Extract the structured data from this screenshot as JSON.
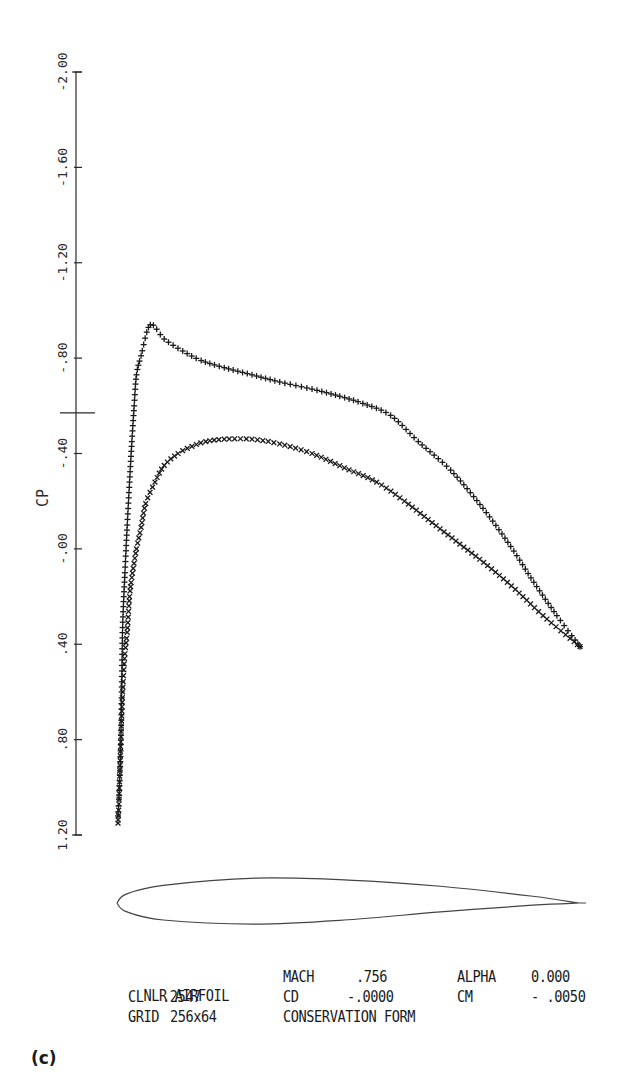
{
  "chart_data": {
    "type": "scatter",
    "title": "",
    "xlabel": "",
    "ylabel": "CP",
    "ylim": [
      -2.0,
      1.2
    ],
    "y_inverted": true,
    "grid": false,
    "y_ticks": [
      "-2.00",
      "-1.60",
      "-1.20",
      "-.80",
      "-.40",
      "-.00",
      ".40",
      ".80",
      "1.20"
    ],
    "y_tick_values": [
      -2.0,
      -1.6,
      -1.2,
      -0.8,
      -0.4,
      0.0,
      0.4,
      0.8,
      1.2
    ],
    "critical_cp_marker": -0.57,
    "series": [
      {
        "name": "upper surface",
        "marker": "+",
        "x": [
          0.0,
          0.002,
          0.004,
          0.006,
          0.008,
          0.01,
          0.015,
          0.02,
          0.025,
          0.03,
          0.035,
          0.04,
          0.05,
          0.07,
          0.1,
          0.14,
          0.18,
          0.23,
          0.29,
          0.35,
          0.42,
          0.48,
          0.53,
          0.59,
          0.65,
          0.72,
          0.79,
          0.85,
          0.9,
          0.95,
          1.0
        ],
        "values": [
          1.12,
          1.05,
          0.95,
          0.82,
          0.6,
          0.33,
          0.1,
          -0.1,
          -0.28,
          -0.45,
          -0.6,
          -0.73,
          -0.81,
          -0.94,
          -0.88,
          -0.83,
          -0.79,
          -0.76,
          -0.73,
          -0.7,
          -0.67,
          -0.64,
          -0.61,
          -0.56,
          -0.45,
          -0.33,
          -0.17,
          -0.01,
          0.14,
          0.28,
          0.41
        ]
      },
      {
        "name": "lower surface",
        "marker": "x",
        "x": [
          0.0,
          0.002,
          0.004,
          0.006,
          0.008,
          0.01,
          0.015,
          0.02,
          0.025,
          0.03,
          0.04,
          0.05,
          0.06,
          0.08,
          0.1,
          0.13,
          0.16,
          0.19,
          0.23,
          0.29,
          0.35,
          0.42,
          0.49,
          0.56,
          0.62,
          0.68,
          0.74,
          0.8,
          0.86,
          0.92,
          1.0
        ],
        "values": [
          1.15,
          1.07,
          0.93,
          0.81,
          0.7,
          0.6,
          0.44,
          0.35,
          0.2,
          0.12,
          0.0,
          -0.09,
          -0.19,
          -0.28,
          -0.35,
          -0.4,
          -0.43,
          -0.45,
          -0.46,
          -0.46,
          -0.44,
          -0.4,
          -0.34,
          -0.28,
          -0.2,
          -0.11,
          -0.02,
          0.07,
          0.17,
          0.28,
          0.41
        ]
      }
    ],
    "airfoil_outline": {
      "upper": [
        [
          0.0,
          0.0
        ],
        [
          0.02,
          0.033
        ],
        [
          0.1,
          0.065
        ],
        [
          0.3,
          0.092
        ],
        [
          0.5,
          0.085
        ],
        [
          0.7,
          0.062
        ],
        [
          0.9,
          0.025
        ],
        [
          1.0,
          0.0
        ]
      ],
      "lower": [
        [
          0.0,
          0.0
        ],
        [
          0.02,
          -0.032
        ],
        [
          0.1,
          -0.063
        ],
        [
          0.3,
          -0.078
        ],
        [
          0.5,
          -0.062
        ],
        [
          0.7,
          -0.033
        ],
        [
          0.9,
          -0.008
        ],
        [
          1.0,
          0.0
        ]
      ]
    }
  },
  "info": {
    "row1": {
      "name": "NLR AIRFOIL",
      "mach_label": "MACH",
      "mach_value": ".756",
      "alpha_label": "ALPHA",
      "alpha_value": "0.000"
    },
    "row2": {
      "cl_label": "CL",
      "cl_value": ".2547",
      "cd_label": "CD",
      "cd_value": "-.0000",
      "cm_label": "CM",
      "cm_value": "- .0050"
    },
    "row3": {
      "grid_label": "GRID",
      "grid_value": "256x64",
      "form": "CONSERVATION FORM"
    }
  },
  "figure_label": "(c)"
}
